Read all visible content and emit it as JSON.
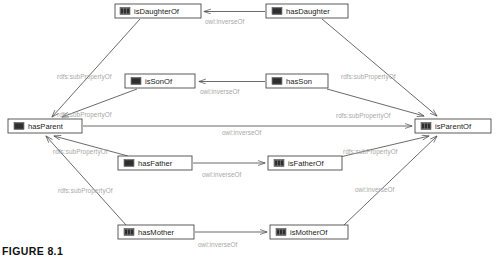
{
  "figure": {
    "caption": "FIGURE 8.1"
  },
  "colors": {
    "node_border": "#4a4a4a",
    "node_fill": "#ffffff",
    "node_text": "#1a1a1a",
    "icon_dark": "#2e2e2e",
    "icon_light": "#7d7d7d",
    "edge_line": "#5a5a5a",
    "edge_label": "#a8a8a8",
    "background": "#ffffff"
  },
  "diagram": {
    "type": "ontology-property-graph",
    "nodes": [
      {
        "id": "isDaughterOf",
        "label": "isDaughterOf",
        "icon": "property-icon",
        "x": 115,
        "y": 4,
        "w": 86,
        "h": 14
      },
      {
        "id": "hasDaughter",
        "label": "hasDaughter",
        "icon": "property-icon",
        "x": 266,
        "y": 4,
        "w": 82,
        "h": 14
      },
      {
        "id": "isSonOf",
        "label": "isSonOf",
        "icon": "property-icon",
        "x": 125,
        "y": 74,
        "w": 70,
        "h": 14
      },
      {
        "id": "hasSon",
        "label": "hasSon",
        "icon": "property-icon",
        "x": 266,
        "y": 74,
        "w": 62,
        "h": 14
      },
      {
        "id": "hasParent",
        "label": "hasParent",
        "icon": "property-icon",
        "x": 8,
        "y": 119,
        "w": 74,
        "h": 14
      },
      {
        "id": "isParentOf",
        "label": "isParentOf",
        "icon": "property-icon",
        "x": 415,
        "y": 119,
        "w": 76,
        "h": 14
      },
      {
        "id": "hasFather",
        "label": "hasFather",
        "icon": "property-icon",
        "x": 118,
        "y": 156,
        "w": 74,
        "h": 14
      },
      {
        "id": "isFatherOf",
        "label": "isFatherOf",
        "icon": "property-icon",
        "x": 268,
        "y": 156,
        "w": 74,
        "h": 14
      },
      {
        "id": "hasMother",
        "label": "hasMother",
        "icon": "property-icon",
        "x": 118,
        "y": 225,
        "w": 76,
        "h": 14
      },
      {
        "id": "isMotherOf",
        "label": "isMotherOf",
        "icon": "property-icon",
        "x": 270,
        "y": 225,
        "w": 78,
        "h": 14
      }
    ],
    "edges": [
      {
        "id": "e1",
        "from": "hasDaughter",
        "to": "isDaughterOf",
        "label": "owl:inverseOf",
        "label_x": 205,
        "label_y": 21
      },
      {
        "id": "e2",
        "from": "hasSon",
        "to": "isSonOf",
        "label": "owl:inverseOf",
        "label_x": 200,
        "label_y": 92
      },
      {
        "id": "e3",
        "from": "hasParent",
        "to": "isParentOf",
        "label": "owl:inverseOf",
        "label_x": 222,
        "label_y": 133
      },
      {
        "id": "e4",
        "from": "hasFather",
        "to": "isFatherOf",
        "label": "owl:inverseOf",
        "label_x": 202,
        "label_y": 175
      },
      {
        "id": "e5",
        "from": "hasMother",
        "to": "isMotherOf",
        "label": "owl:inverseOf",
        "label_x": 198,
        "label_y": 245
      },
      {
        "id": "e6",
        "from": "isDaughterOf",
        "to": "hasParent",
        "label": "rdfs:subPropertyOf",
        "label_x": 57,
        "label_y": 77
      },
      {
        "id": "e7",
        "from": "isSonOf",
        "to": "hasParent",
        "label": "rdfs:subPropertyOf",
        "label_x": 57,
        "label_y": 115
      },
      {
        "id": "e8",
        "from": "hasFather",
        "to": "hasParent",
        "label": "rdfs:subPropertyOf",
        "label_x": 53,
        "label_y": 152
      },
      {
        "id": "e9",
        "from": "hasMother",
        "to": "hasParent",
        "label": "rdfs:subPropertyOf",
        "label_x": 58,
        "label_y": 191
      },
      {
        "id": "e10",
        "from": "hasDaughter",
        "to": "isParentOf",
        "label": "rdfs:subPropertyOf",
        "label_x": 341,
        "label_y": 77
      },
      {
        "id": "e11",
        "from": "hasSon",
        "to": "isParentOf",
        "label": "rdfs:subPropertyOf",
        "label_x": 336,
        "label_y": 116
      },
      {
        "id": "e12",
        "from": "isFatherOf",
        "to": "isParentOf",
        "label": "rdfs:subPropertyOf",
        "label_x": 343,
        "label_y": 152
      },
      {
        "id": "e13",
        "from": "isMotherOf",
        "to": "isParentOf",
        "label": "owl:inverseOf",
        "label_x": 355,
        "label_y": 190
      }
    ]
  }
}
